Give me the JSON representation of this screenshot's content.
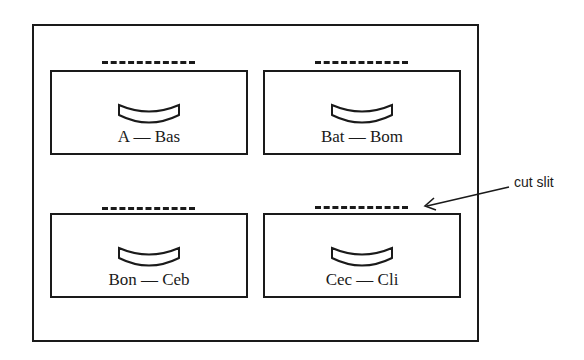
{
  "diagram": {
    "type": "card catalog cabinet front",
    "drawers": [
      {
        "label": "A — Bas"
      },
      {
        "label": "Bat — Bom"
      },
      {
        "label": "Bon — Ceb"
      },
      {
        "label": "Cec — Cli"
      }
    ],
    "callout": {
      "label": "cut slit"
    },
    "colors": {
      "line": "#1a1a1a",
      "background": "#ffffff"
    }
  }
}
